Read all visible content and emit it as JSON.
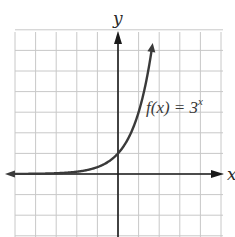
{
  "chart_data": {
    "type": "line",
    "title": "",
    "xlabel": "x",
    "ylabel": "y",
    "function_label": "f(x) = 3^x",
    "function_label_parts": {
      "base": "f(x) = 3",
      "exponent": "x"
    },
    "xlim": [
      -5.2,
      5.1
    ],
    "ylim": [
      -3,
      7
    ],
    "grid": true,
    "grid_step": 1,
    "tick_labels": false,
    "series": [
      {
        "name": "f(x) = 3^x",
        "x": [
          -5,
          -4,
          -3,
          -2,
          -1,
          0,
          0.5,
          1,
          1.3,
          1.6,
          1.75
        ],
        "values": [
          0.004,
          0.012,
          0.037,
          0.111,
          0.333,
          1,
          1.732,
          3,
          4.17,
          5.8,
          6.84
        ]
      }
    ],
    "y_intercept": [
      0,
      1
    ],
    "horizontal_asymptote": "y = 0",
    "colors": {
      "curve": "#3a3a3a",
      "axis": "#1a1a1a",
      "grid": "#c8c8c8"
    }
  },
  "labels": {
    "x_axis": "x",
    "y_axis": "y",
    "function_base": "f(x) = 3",
    "function_exp": "x"
  }
}
